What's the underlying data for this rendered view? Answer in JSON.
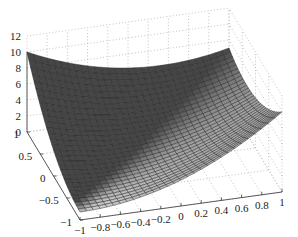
{
  "chart_data": {
    "type": "surface",
    "title": "",
    "xlabel": "",
    "ylabel": "",
    "zlabel": "",
    "x_ticks": [
      "-1",
      "-0.8",
      "-0.6",
      "-0.4",
      "-0.2",
      "0",
      "0.2",
      "0.4",
      "0.6",
      "0.8",
      "1"
    ],
    "y_ticks": [
      "-1",
      "-0.5",
      "0",
      "0.5",
      "1"
    ],
    "z_ticks": [
      "0",
      "2",
      "4",
      "6",
      "8",
      "10",
      "12"
    ],
    "xlim": [
      -1,
      1
    ],
    "ylim": [
      -1,
      1
    ],
    "zlim": [
      0,
      12
    ],
    "grid": true,
    "colormap": "gray",
    "mesh_resolution": 30,
    "surface_description": "Bowl-shaped surface; highest (~10) at corners (x=-1,y=1) and (x=1,y=-1), minimum (~1) near (x=-1,y=-1), ~7 at (x=1,y=1)",
    "corner_values": [
      {
        "x": -1,
        "y": -1,
        "z": 1
      },
      {
        "x": 1,
        "y": -1,
        "z": 10
      },
      {
        "x": -1,
        "y": 1,
        "z": 10
      },
      {
        "x": 1,
        "y": 1,
        "z": 7
      }
    ]
  }
}
